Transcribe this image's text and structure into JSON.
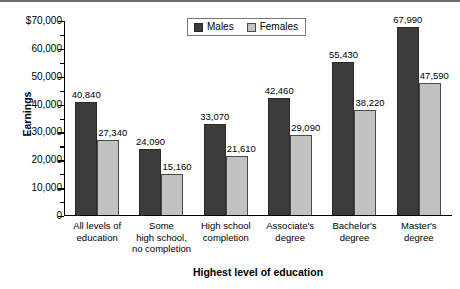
{
  "chart_data": {
    "type": "bar",
    "title": "",
    "xlabel": "Highest level of education",
    "ylabel": "Earnings",
    "categories": [
      "All levels of education",
      "Some high school, no completion",
      "High school completion",
      "Associate's degree",
      "Bachelor's degree",
      "Master's degree"
    ],
    "category_lines": [
      [
        "All levels of",
        "education"
      ],
      [
        "Some",
        "high school,",
        "no completion"
      ],
      [
        "High school",
        "completion"
      ],
      [
        "Associate's",
        "degree"
      ],
      [
        "Bachelor's",
        "degree"
      ],
      [
        "Master's",
        "degree"
      ]
    ],
    "series": [
      {
        "name": "Males",
        "color": "#3c3c3c",
        "values": [
          40840,
          24090,
          33070,
          42460,
          55430,
          67990
        ],
        "labels": [
          "40,840",
          "24,090",
          "33,070",
          "42,460",
          "55,430",
          "67,990"
        ]
      },
      {
        "name": "Females",
        "color": "#c2c2c2",
        "values": [
          27340,
          15160,
          21610,
          29090,
          38220,
          47590
        ],
        "labels": [
          "27,340",
          "15,160",
          "21,610",
          "29,090",
          "38,220",
          "47,590"
        ]
      }
    ],
    "ylim": [
      0,
      70000
    ],
    "y_ticks": [
      0,
      10000,
      20000,
      30000,
      40000,
      50000,
      60000,
      70000
    ],
    "y_tick_labels": [
      "0",
      "10,000",
      "20,000",
      "30,000",
      "40,000",
      "50,000",
      "60,000",
      "$70,000"
    ],
    "y_minor_tick_step": 5000,
    "grid": false,
    "legend_position": "top-center"
  },
  "legend": {
    "items": [
      {
        "label": "Males"
      },
      {
        "label": "Females"
      }
    ]
  },
  "axes": {
    "y_title": "Earnings",
    "x_title": "Highest level of education"
  }
}
